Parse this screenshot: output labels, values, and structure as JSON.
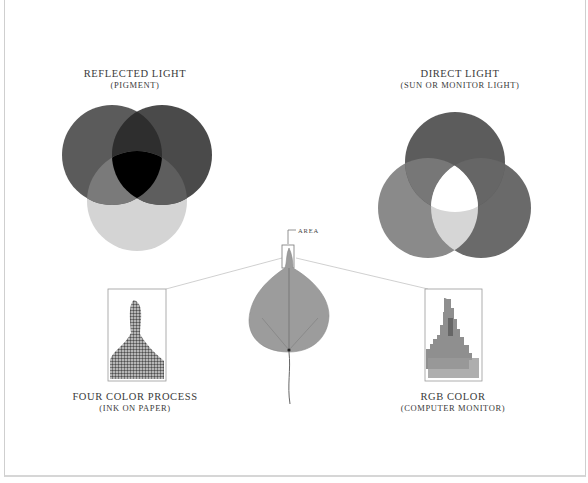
{
  "figure": {
    "reflected_light": {
      "title": "REFLECTED LIGHT",
      "subtitle": "(PIGMENT)"
    },
    "direct_light": {
      "title": "DIRECT LIGHT",
      "subtitle": "(SUN OR MONITOR LIGHT)"
    },
    "area_label": "AREA",
    "four_color": {
      "title": "FOUR COLOR PROCESS",
      "subtitle": "(INK ON PAPER)"
    },
    "rgb_color": {
      "title": "RGB COLOR",
      "subtitle": "(COMPUTER MONITOR)"
    }
  },
  "colors": {
    "subtractive_circle_1": "#5a5a5a",
    "subtractive_circle_2": "#4a4a4a",
    "subtractive_circle_3": "#d4d4d4",
    "subtractive_center": "#000000",
    "additive_top": "#5c5c5c",
    "additive_left": "#8a8a8a",
    "additive_right": "#6a6a6a",
    "additive_center": "#ffffff",
    "leaf": "#9a9a9a",
    "callout_line": "#c4c4c4"
  }
}
